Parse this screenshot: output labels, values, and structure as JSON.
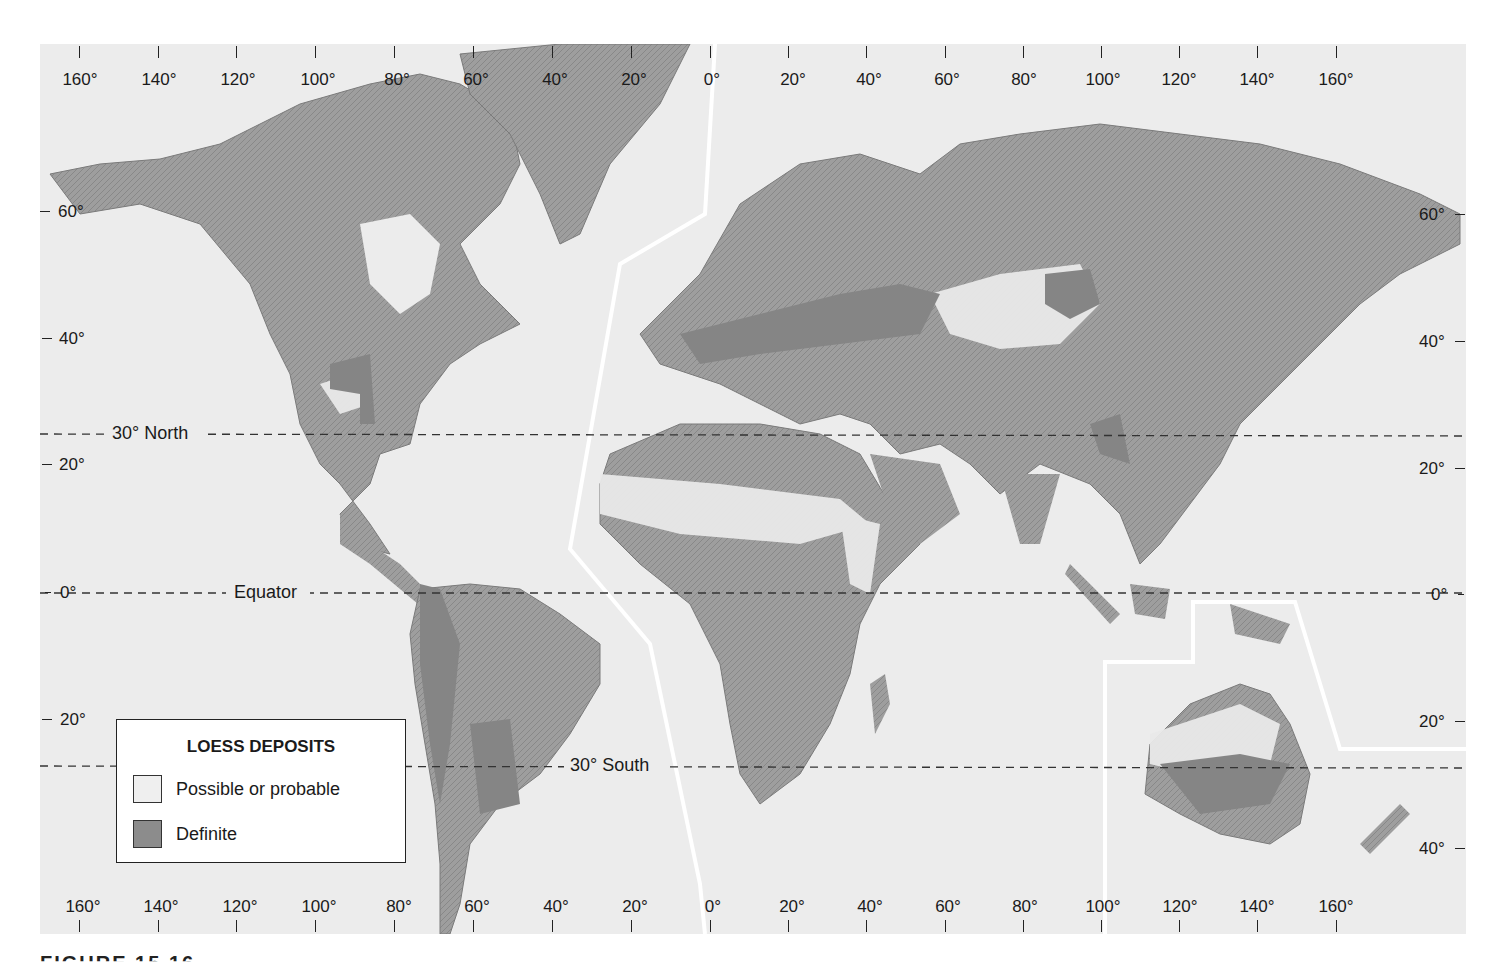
{
  "map": {
    "title": "LOESS DEPOSITS",
    "colors": {
      "ocean": "#ececec",
      "land": "#9a9a9a",
      "land_dark": "#7d7d7d",
      "possible": "#e6e6e6",
      "definite": "#8a8a8a",
      "boundary": "#ffffff",
      "dashed": "#333333"
    },
    "longitude_labels_top": [
      "160°",
      "140°",
      "120°",
      "100°",
      "80°",
      "60°",
      "40°",
      "20°",
      "0°",
      "20°",
      "40°",
      "60°",
      "80°",
      "100°",
      "120°",
      "140°",
      "160°"
    ],
    "longitude_labels_bottom": [
      "160°",
      "140°",
      "120°",
      "100°",
      "80°",
      "60°",
      "40°",
      "20°",
      "0°",
      "20°",
      "40°",
      "60°",
      "80°",
      "100°",
      "120°",
      "140°",
      "160°"
    ],
    "latitude_labels_left": [
      "60°",
      "40°",
      "20°",
      "0°",
      "20°"
    ],
    "latitude_labels_right": [
      "60°",
      "40°",
      "20°",
      "0°",
      "20°",
      "40°"
    ],
    "reference_lines": {
      "north": "30° North",
      "equator": "Equator",
      "south": "30° South"
    },
    "legend": {
      "title": "LOESS DEPOSITS",
      "items": [
        {
          "label": "Possible or probable",
          "color": "#efefef"
        },
        {
          "label": "Definite",
          "color": "#8c8c8c"
        }
      ]
    },
    "caption": "FIGURE 15.16"
  }
}
